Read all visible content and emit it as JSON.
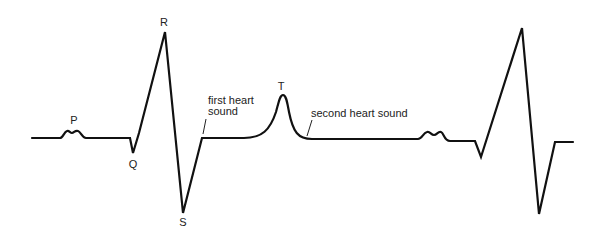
{
  "diagram": {
    "wave_labels": {
      "p": "P",
      "q": "Q",
      "r": "R",
      "s": "S",
      "t": "T"
    },
    "annotations": {
      "first_heart_sound_line1": "first heart",
      "first_heart_sound_line2": "sound",
      "second_heart_sound": "second heart sound"
    },
    "colors": {
      "trace": "#111111",
      "background": "#ffffff"
    }
  }
}
